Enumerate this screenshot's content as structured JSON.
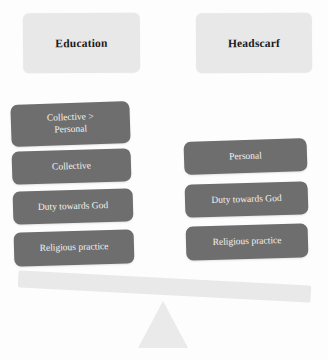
{
  "diagram": {
    "background_color": "#fdfdfd",
    "header_color": "#e8e8e8",
    "box_color": "#6e6e6e",
    "box_text_color": "#f4f2ee",
    "beam_color": "#e9e9e9",
    "fulcrum_color": "#eaeaea",
    "headers": [
      {
        "id": "education",
        "label": "Education"
      },
      {
        "id": "headscarf",
        "label": "Headscarf"
      }
    ],
    "left_column": {
      "header_ref": "education",
      "items": [
        {
          "line1": "Collective >",
          "line2": "Personal"
        },
        {
          "line1": "Collective",
          "line2": ""
        },
        {
          "line1": "Duty towards God",
          "line2": ""
        },
        {
          "line1": "Religious practice",
          "line2": ""
        }
      ]
    },
    "right_column": {
      "header_ref": "headscarf",
      "items": [
        {
          "line1": "Personal",
          "line2": ""
        },
        {
          "line1": "Duty towards God",
          "line2": ""
        },
        {
          "line1": "Religious practice",
          "line2": ""
        }
      ]
    },
    "balance": {
      "tilt_direction": "left-side-down",
      "tilt_degrees": 3
    }
  }
}
